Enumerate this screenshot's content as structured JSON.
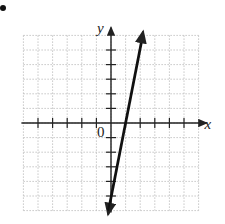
{
  "chart_data": {
    "type": "line",
    "title": "",
    "xlabel": "x",
    "ylabel": "y",
    "origin_label": "0",
    "xlim": [
      -6,
      6
    ],
    "ylim": [
      -6,
      6
    ],
    "grid": true,
    "grid_style": "dotted",
    "tick_marks": {
      "x": [
        -5,
        -4,
        -3,
        -2,
        -1,
        1,
        2,
        3,
        4,
        5
      ],
      "y": [
        -5,
        -4,
        -3,
        -2,
        -1,
        1,
        2,
        3,
        4,
        5
      ]
    },
    "series": [
      {
        "name": "line",
        "equation": "y = 5x - 5",
        "x": [
          -0.2,
          1,
          2.2
        ],
        "y": [
          -6,
          0,
          6
        ],
        "arrows": "both"
      }
    ]
  },
  "colors": {
    "axis": "#222222",
    "grid": "#b8b8b8",
    "line": "#111111"
  }
}
